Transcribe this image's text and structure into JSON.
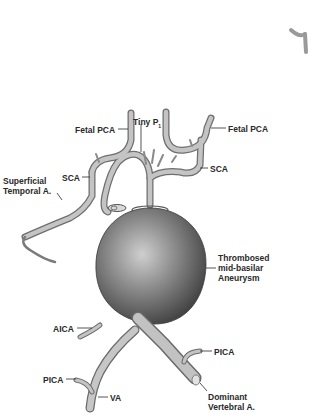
{
  "figure": {
    "colors": {
      "background": "#ffffff",
      "vessel_fill": "#b9b9b9",
      "vessel_shadow": "#6f6f6f",
      "aneurysm_dark": "#4a4a4a",
      "aneurysm_light": "#c8c8c8",
      "label_text": "#2a2a2a",
      "leader_line": "#2a2a2a"
    }
  },
  "labels": {
    "fetal_pca_left": "Fetal PCA",
    "tiny_p1": "Tiny P",
    "tiny_p1_sub": "1",
    "fetal_pca_right": "Fetal PCA",
    "sca_left": "SCA",
    "sca_right": "SCA",
    "superficial_temporal_line1": "Superficial",
    "superficial_temporal_line2": "Temporal A.",
    "aneurysm_line1": "Thrombosed",
    "aneurysm_line2": "mid-basilar",
    "aneurysm_line3": "Aneurysm",
    "aica": "AICA",
    "pica_right": "PICA",
    "pica_left": "PICA",
    "va": "VA",
    "dominant_va_line1": "Dominant",
    "dominant_va_line2": "Vertebral A."
  }
}
